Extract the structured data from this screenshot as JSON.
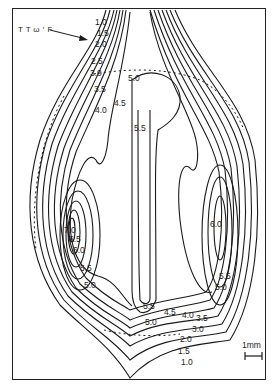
{
  "figure": {
    "annotation": "T T ω ′ F",
    "scale_label": "1mm",
    "scale_icon": "scale-bar-icon",
    "arrow_icon": "pointer-arrow-icon"
  },
  "contour_labels": {
    "left_top": [
      "1.0",
      "1.5",
      "2.0",
      "2.5",
      "3.0",
      "3.5",
      "4.0"
    ],
    "center_top": [
      "4.5",
      "5.0",
      "5.5"
    ],
    "left_lobe": [
      "7.0",
      "6.5",
      "6.0",
      "5.5",
      "5.0"
    ],
    "right_lobe": [
      "6.0",
      "5.5",
      "5.0"
    ],
    "bottom_center": [
      "5.5",
      "5.0",
      "4.5",
      "4.0",
      "3.5",
      "3.0",
      "2.0",
      "1.5",
      "1.0"
    ]
  }
}
